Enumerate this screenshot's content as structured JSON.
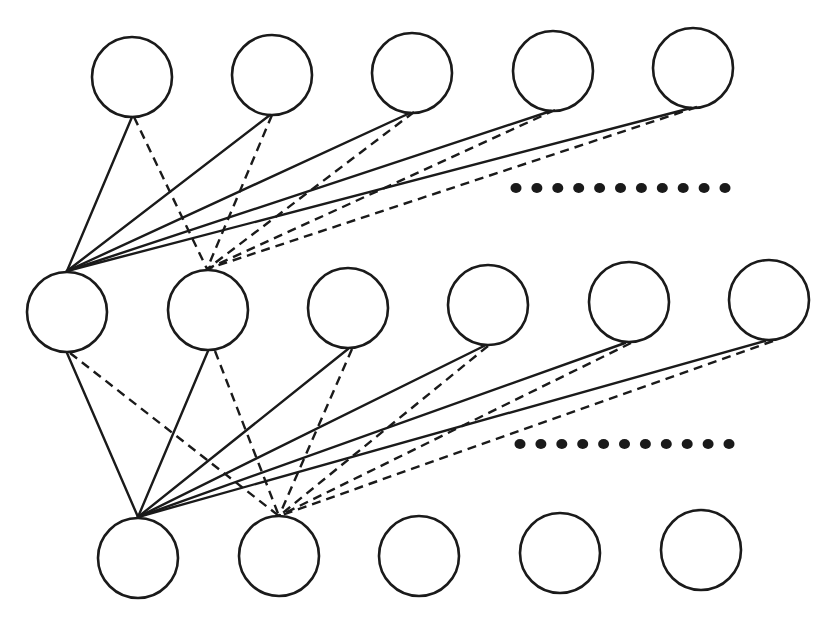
{
  "diagram": {
    "type": "layered-network",
    "stroke_color": "#1a1a1a",
    "background": "#ffffff",
    "node_radius": 40,
    "layers": [
      {
        "name": "top-layer",
        "nodes": [
          {
            "cx": 132,
            "cy": 77
          },
          {
            "cx": 272,
            "cy": 75
          },
          {
            "cx": 412,
            "cy": 73
          },
          {
            "cx": 553,
            "cy": 71
          },
          {
            "cx": 693,
            "cy": 68
          }
        ]
      },
      {
        "name": "middle-layer",
        "nodes": [
          {
            "cx": 67,
            "cy": 312
          },
          {
            "cx": 208,
            "cy": 310
          },
          {
            "cx": 348,
            "cy": 308
          },
          {
            "cx": 488,
            "cy": 305
          },
          {
            "cx": 629,
            "cy": 302
          },
          {
            "cx": 769,
            "cy": 300
          }
        ]
      },
      {
        "name": "bottom-layer",
        "nodes": [
          {
            "cx": 138,
            "cy": 558
          },
          {
            "cx": 279,
            "cy": 556
          },
          {
            "cx": 419,
            "cy": 556
          },
          {
            "cx": 560,
            "cy": 553
          },
          {
            "cx": 701,
            "cy": 550
          }
        ]
      }
    ],
    "ellipsis_rows": [
      {
        "name": "upper-ellipsis",
        "x_start": 516,
        "x_end": 725,
        "y": 188,
        "count": 11,
        "dot_radius": 5
      },
      {
        "name": "lower-ellipsis",
        "x_start": 520,
        "x_end": 729,
        "y": 444,
        "count": 11,
        "dot_radius": 5
      }
    ],
    "edges": {
      "solid": [
        {
          "from": [
            132,
            117
          ],
          "to": [
            67,
            271
          ]
        },
        {
          "from": [
            270,
            115
          ],
          "to": [
            67,
            271
          ]
        },
        {
          "from": [
            410,
            113
          ],
          "to": [
            67,
            271
          ]
        },
        {
          "from": [
            551,
            111
          ],
          "to": [
            67,
            271
          ]
        },
        {
          "from": [
            691,
            108
          ],
          "to": [
            67,
            271
          ]
        },
        {
          "from": [
            67,
            353
          ],
          "to": [
            138,
            517
          ]
        },
        {
          "from": [
            208,
            351
          ],
          "to": [
            138,
            517
          ]
        },
        {
          "from": [
            348,
            349
          ],
          "to": [
            138,
            517
          ]
        },
        {
          "from": [
            484,
            346
          ],
          "to": [
            138,
            517
          ]
        },
        {
          "from": [
            625,
            343
          ],
          "to": [
            138,
            517
          ]
        },
        {
          "from": [
            765,
            341
          ],
          "to": [
            138,
            517
          ]
        }
      ],
      "dashed": [
        {
          "from": [
            134,
            117
          ],
          "to": [
            207,
            269
          ]
        },
        {
          "from": [
            272,
            115
          ],
          "to": [
            207,
            269
          ]
        },
        {
          "from": [
            414,
            112
          ],
          "to": [
            207,
            269
          ]
        },
        {
          "from": [
            555,
            110
          ],
          "to": [
            207,
            269
          ]
        },
        {
          "from": [
            697,
            107
          ],
          "to": [
            207,
            269
          ]
        },
        {
          "from": [
            70,
            353
          ],
          "to": [
            279,
            516
          ]
        },
        {
          "from": [
            215,
            351
          ],
          "to": [
            279,
            516
          ]
        },
        {
          "from": [
            352,
            349
          ],
          "to": [
            279,
            516
          ]
        },
        {
          "from": [
            488,
            346
          ],
          "to": [
            279,
            516
          ]
        },
        {
          "from": [
            631,
            343
          ],
          "to": [
            279,
            516
          ]
        },
        {
          "from": [
            773,
            341
          ],
          "to": [
            279,
            516
          ]
        }
      ]
    }
  }
}
